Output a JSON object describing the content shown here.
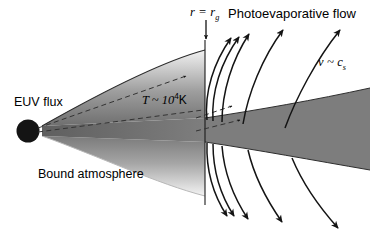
{
  "figure": {
    "name": "photoevaporation-diagram",
    "background_color": "#ffffff",
    "line_color": "#1a1a1a"
  },
  "labels": {
    "euv_flux": "EUV flux",
    "temperature_prefix": "T ~ 10",
    "temperature_exponent": "4",
    "temperature_unit": "K",
    "bound_atmosphere": "Bound atmosphere",
    "photoevaporative_flow": "Photoevaporative flow",
    "gravitational_radius_r": "r",
    "gravitational_radius_eq": "=",
    "gravitational_radius_rg": "r",
    "gravitational_radius_sub": "g",
    "velocity_v": "v",
    "velocity_tilde": "~",
    "velocity_cs": "c",
    "velocity_sub": "s"
  },
  "elements": {
    "central_body": "central-star-disk",
    "radius_marker": "r-g-vertical-line",
    "radius_arrow": "r-g-down-arrow",
    "euv_ray_upper": "euv-dashed-ray-upper",
    "euv_ray_lower": "euv-dashed-ray-lower",
    "bound_wedge": "bound-atmosphere-wedge",
    "outflow_wedge": "photoevaporative-wedge",
    "streamlines_up": 5,
    "streamlines_down": 5
  },
  "colors": {
    "disk": "#141414",
    "wedge_dark": "#7d7d7d",
    "wedge_mid": "#9a9a9a",
    "wedge_light": "#d8d8d8",
    "stroke": "#1a1a1a"
  }
}
